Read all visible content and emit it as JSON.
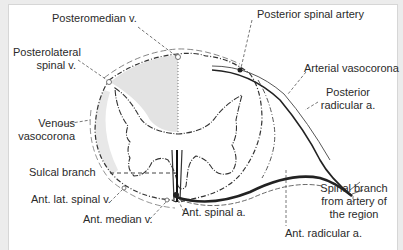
{
  "figure": {
    "colors": {
      "background": "#ffffff",
      "frame": "#d6d6d6",
      "shaded_territory": "#e3e3e3",
      "line": "#333333",
      "artery": "#2b2b2b"
    }
  },
  "labels": {
    "posteromedian_v": "Posteromedian v.",
    "posterolateral_v_1": "Posterolateral",
    "posterolateral_v_2": "spinal v.",
    "venous_vasocorona_1": "Venous",
    "venous_vasocorona_2": "vasocorona",
    "sulcal_branch": "Sulcal branch",
    "ant_lat_spinal_v": "Ant. lat. spinal v.",
    "ant_median_v": "Ant. median v.",
    "ant_spinal_a": "Ant. spinal a.",
    "posterior_spinal_artery": "Posterior spinal artery",
    "arterial_vasocorona": "Arterial vasocorona",
    "posterior_radicular_1": "Posterior",
    "posterior_radicular_2": "radicular a.",
    "spinal_branch_1": "Spinal branch",
    "spinal_branch_2": "from artery of",
    "spinal_branch_3": "the region",
    "ant_radicular_a": "Ant. radicular a."
  }
}
